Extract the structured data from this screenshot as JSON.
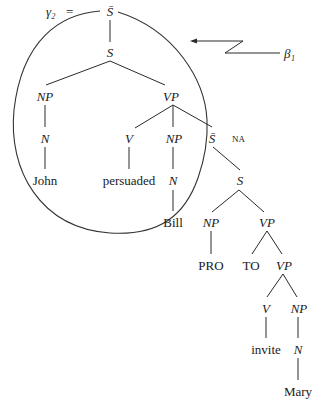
{
  "diagram": {
    "tree_name": "γ₂",
    "equals": "=",
    "auxiliary_label": "β₁",
    "nodes": {
      "root": "S̄",
      "s1": "S",
      "np1": "NP",
      "vp1": "VP",
      "n1": "N",
      "v1": "V",
      "np2": "NP",
      "sbar2": "S̄",
      "na": "NA",
      "john": "John",
      "persuaded": "persuaded",
      "n2": "N",
      "s2": "S",
      "bill": "Bill",
      "np3": "NP",
      "vp2": "VP",
      "pro": "PRO",
      "to": "TO",
      "vp3": "VP",
      "v2": "V",
      "np4": "NP",
      "invite": "invite",
      "n3": "N",
      "mary": "Mary"
    }
  }
}
